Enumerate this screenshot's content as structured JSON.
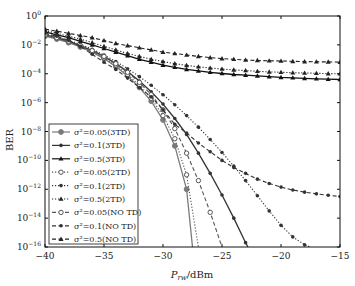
{
  "chart_data": {
    "type": "line",
    "title": "",
    "xlabel": "P_rw/dBm",
    "ylabel": "BER",
    "xlim": [
      -40,
      -15
    ],
    "ylim_log10": [
      -16,
      0
    ],
    "yscale": "log",
    "grid": false,
    "legend_position": "lower left",
    "x_ticks": [
      "-40",
      "-35",
      "-30",
      "-25",
      "-20",
      "-15"
    ],
    "y_ticks": [
      "10^0",
      "10^-2",
      "10^-4",
      "10^-6",
      "10^-8",
      "10^-10",
      "10^-12",
      "10^-14",
      "10^-16"
    ],
    "series": [
      {
        "name": "σ²=0.05(3TD)",
        "style": "solid",
        "marker": "filled-circle",
        "color": "#7a7a7a",
        "x": [
          -40,
          -39,
          -38,
          -37,
          -36,
          -35,
          -34,
          -33,
          -32,
          -31,
          -30,
          -29,
          -28,
          -27.5
        ],
        "log10_ber": [
          -1.4,
          -1.6,
          -1.85,
          -2.15,
          -2.5,
          -2.95,
          -3.5,
          -4.15,
          -4.95,
          -5.9,
          -7.2,
          -9.0,
          -12.0,
          -16.0
        ]
      },
      {
        "name": "σ²=0.1(3TD)",
        "style": "solid",
        "marker": "filled-circle-small",
        "color": "#333333",
        "x": [
          -40,
          -39,
          -38,
          -37,
          -36,
          -35,
          -34,
          -33,
          -32,
          -31,
          -30,
          -29,
          -28,
          -27,
          -26,
          -25,
          -24,
          -23,
          -22.8
        ],
        "log10_ber": [
          -1.3,
          -1.5,
          -1.75,
          -2.05,
          -2.4,
          -2.8,
          -3.3,
          -3.85,
          -4.5,
          -5.25,
          -6.1,
          -7.1,
          -8.2,
          -9.5,
          -10.9,
          -12.4,
          -14.0,
          -15.7,
          -16.0
        ]
      },
      {
        "name": "σ²=0.5(3TD)",
        "style": "solid",
        "marker": "filled-triangle",
        "color": "#111111",
        "x": [
          -40,
          -39,
          -38,
          -37,
          -36,
          -35,
          -34,
          -33,
          -32,
          -31,
          -30,
          -29,
          -28,
          -27,
          -26,
          -25,
          -24,
          -23,
          -22,
          -21,
          -20,
          -19,
          -18,
          -17,
          -16,
          -15
        ],
        "log10_ber": [
          -1.1,
          -1.3,
          -1.5,
          -1.75,
          -2.0,
          -2.25,
          -2.5,
          -2.75,
          -3.0,
          -3.2,
          -3.4,
          -3.55,
          -3.7,
          -3.8,
          -3.9,
          -3.98,
          -4.05,
          -4.1,
          -4.15,
          -4.2,
          -4.25,
          -4.28,
          -4.32,
          -4.35,
          -4.38,
          -4.4
        ]
      },
      {
        "name": "σ²=0.05(2TD)",
        "style": "dotted",
        "marker": "open-circle",
        "color": "#555555",
        "x": [
          -40,
          -39,
          -38,
          -37,
          -36,
          -35,
          -34,
          -33,
          -32,
          -31,
          -30,
          -29,
          -28,
          -27
        ],
        "log10_ber": [
          -1.35,
          -1.55,
          -1.8,
          -2.1,
          -2.45,
          -2.9,
          -3.4,
          -4.05,
          -4.8,
          -5.7,
          -6.9,
          -8.5,
          -11.0,
          -16.0
        ]
      },
      {
        "name": "σ²=0.1(2TD)",
        "style": "dotted",
        "marker": "filled-circle-small",
        "color": "#333333",
        "x": [
          -40,
          -39,
          -38,
          -37,
          -36,
          -35,
          -34,
          -33,
          -32,
          -31,
          -30,
          -29,
          -28,
          -27,
          -26,
          -25,
          -24,
          -23,
          -22,
          -21,
          -20,
          -19,
          -18,
          -17.5
        ],
        "log10_ber": [
          -1.25,
          -1.45,
          -1.7,
          -1.95,
          -2.3,
          -2.7,
          -3.15,
          -3.65,
          -4.2,
          -4.8,
          -5.45,
          -6.15,
          -6.9,
          -7.7,
          -8.55,
          -9.45,
          -10.4,
          -11.4,
          -12.45,
          -13.5,
          -14.5,
          -15.3,
          -15.85,
          -16.0
        ]
      },
      {
        "name": "σ²=0.5(2TD)",
        "style": "dotted",
        "marker": "filled-triangle",
        "color": "#222222",
        "x": [
          -40,
          -39,
          -38,
          -37,
          -36,
          -35,
          -34,
          -33,
          -32,
          -31,
          -30,
          -29,
          -28,
          -27,
          -26,
          -25,
          -24,
          -23,
          -22,
          -21,
          -20,
          -19,
          -18,
          -17,
          -16,
          -15
        ],
        "log10_ber": [
          -1.0,
          -1.2,
          -1.4,
          -1.6,
          -1.85,
          -2.1,
          -2.35,
          -2.6,
          -2.8,
          -3.0,
          -3.15,
          -3.3,
          -3.42,
          -3.52,
          -3.6,
          -3.67,
          -3.73,
          -3.78,
          -3.83,
          -3.87,
          -3.9,
          -3.93,
          -3.95,
          -3.97,
          -3.99,
          -4.0
        ]
      },
      {
        "name": "σ²=0.05(NO TD)",
        "style": "dashed",
        "marker": "open-circle",
        "color": "#555555",
        "x": [
          -40,
          -39,
          -38,
          -37,
          -36,
          -35,
          -34,
          -33,
          -32,
          -31,
          -30,
          -29,
          -28,
          -27,
          -26,
          -25
        ],
        "log10_ber": [
          -1.3,
          -1.5,
          -1.75,
          -2.05,
          -2.4,
          -2.8,
          -3.3,
          -3.9,
          -4.6,
          -5.45,
          -6.5,
          -7.8,
          -9.5,
          -11.4,
          -13.6,
          -16.0
        ]
      },
      {
        "name": "σ²=0.1(NO TD)",
        "style": "dashed",
        "marker": "filled-circle-small",
        "color": "#333333",
        "x": [
          -40,
          -39,
          -38,
          -37,
          -36,
          -35,
          -34,
          -33,
          -32,
          -31,
          -30,
          -29,
          -28,
          -27,
          -26,
          -25,
          -24,
          -23,
          -22,
          -21,
          -20,
          -19,
          -18,
          -17,
          -16,
          -15
        ],
        "log10_ber": [
          -1.2,
          -1.4,
          -1.7,
          -2.1,
          -2.65,
          -3.2,
          -3.7,
          -4.3,
          -4.95,
          -5.6,
          -6.5,
          -7.5,
          -8.1,
          -8.8,
          -9.4,
          -10.0,
          -10.5,
          -10.9,
          -11.3,
          -11.6,
          -11.85,
          -12.05,
          -12.2,
          -12.32,
          -12.42,
          -12.5
        ]
      },
      {
        "name": "σ²=0.5(NO TD)",
        "style": "dashed",
        "marker": "filled-triangle",
        "color": "#222222",
        "x": [
          -40,
          -39,
          -38,
          -37,
          -36,
          -35,
          -34,
          -33,
          -32,
          -31,
          -30,
          -29,
          -28,
          -27,
          -26,
          -25,
          -24,
          -23,
          -22,
          -21,
          -20,
          -19,
          -18,
          -17,
          -16,
          -15
        ],
        "log10_ber": [
          -0.9,
          -1.05,
          -1.2,
          -1.35,
          -1.5,
          -1.7,
          -1.9,
          -2.05,
          -2.2,
          -2.35,
          -2.5,
          -2.6,
          -2.7,
          -2.8,
          -2.88,
          -2.95,
          -3.0,
          -3.05,
          -3.08,
          -3.1,
          -3.12,
          -3.14,
          -3.16,
          -3.17,
          -3.18,
          -3.2
        ]
      }
    ]
  },
  "axes": {
    "xlabel_main": "P",
    "xlabel_sub": "rw",
    "xlabel_unit": "/dBm",
    "ylabel": "BER"
  },
  "legend": {
    "entries": [
      {
        "label": "σ²=0.05(3TD)"
      },
      {
        "label": "σ²=0.1(3TD)"
      },
      {
        "label": "σ²=0.5(3TD)"
      },
      {
        "label": "σ²=0.05(2TD)"
      },
      {
        "label": "σ²=0.1(2TD)"
      },
      {
        "label": "σ²=0.5(2TD)"
      },
      {
        "label": "σ²=0.05(NO TD)"
      },
      {
        "label": "σ²=0.1(NO TD)"
      },
      {
        "label": "σ²=0.5(NO TD)"
      }
    ]
  }
}
